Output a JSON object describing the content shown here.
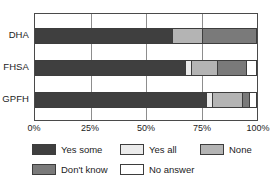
{
  "chart_data": {
    "type": "bar",
    "orientation": "horizontal",
    "stacked": true,
    "normalized": "100%",
    "title": "",
    "xlabel": "",
    "ylabel": "",
    "categories": [
      "DHA",
      "FHSA",
      "GPFH"
    ],
    "xticks": [
      "0%",
      "25%",
      "50%",
      "75%",
      "100%"
    ],
    "xtick_values": [
      0,
      25,
      50,
      75,
      100
    ],
    "xlim": [
      0,
      100
    ],
    "grid": true,
    "grid_axis": "x",
    "legend_position": "bottom",
    "series": [
      {
        "name": "Yes some",
        "color": "#3f3f3f",
        "values": [
          62.0,
          68.0,
          77.5
        ]
      },
      {
        "name": "Yes all",
        "color": "#ebebeb",
        "values": [
          0.0,
          2.5,
          2.5
        ]
      },
      {
        "name": "None",
        "color": "#b4b4b4",
        "values": [
          13.5,
          12.0,
          13.5
        ]
      },
      {
        "name": "Don't know",
        "color": "#7a7a7a",
        "values": [
          24.5,
          13.0,
          3.5
        ]
      },
      {
        "name": "No answer",
        "color": "#ffffff",
        "values": [
          0.0,
          4.5,
          3.0
        ]
      }
    ]
  },
  "legend": {
    "items": [
      {
        "label": "Yes some",
        "color": "#3f3f3f"
      },
      {
        "label": "Yes all",
        "color": "#ebebeb"
      },
      {
        "label": "None",
        "color": "#b4b4b4"
      },
      {
        "label": "Don't know",
        "color": "#7a7a7a"
      },
      {
        "label": "No answer",
        "color": "#ffffff"
      }
    ]
  },
  "colors": {
    "axis": "#4a4a4a",
    "gridline": "#8d8d8d",
    "segment_border": "#3d3d3d",
    "text": "#1c1c1c",
    "background": "#ffffff"
  }
}
